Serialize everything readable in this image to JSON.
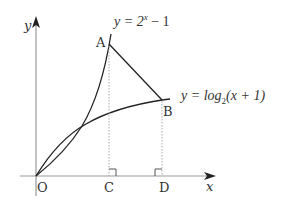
{
  "diagram": {
    "axes": {
      "x_label": "x",
      "y_label": "y",
      "origin_label": "O"
    },
    "curves": [
      {
        "id": "exp",
        "equation_prefix": "y = 2",
        "exponent": "x",
        "equation_suffix": " − 1"
      },
      {
        "id": "log",
        "equation_prefix": "y = log",
        "subscript": "2",
        "equation_suffix": "(x + 1)"
      }
    ],
    "points": {
      "A": "A",
      "B": "B",
      "C": "C",
      "D": "D"
    },
    "colors": {
      "curve": "#222222",
      "axis": "#999999",
      "dotted": "#aaaaaa"
    }
  }
}
